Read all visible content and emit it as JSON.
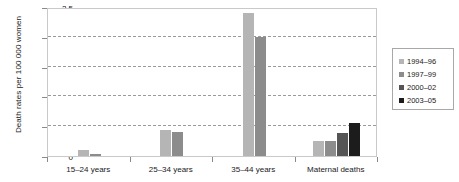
{
  "chart_data": {
    "type": "bar",
    "title": "",
    "xlabel": "",
    "ylabel": "Death rates per 100 000 women",
    "ylim": [
      0,
      2.5
    ],
    "ytick_values": [
      0,
      0.5,
      1,
      1.5,
      2,
      2.5
    ],
    "ytick_labels": [
      "0",
      "0.5",
      "1",
      "1.5",
      "2",
      "2.5"
    ],
    "grid": true,
    "grid_style": "dashed-horizontal",
    "legend_position": "right",
    "categories": [
      "15–24 years",
      "25–34 years",
      "35–44 years",
      "Maternal deaths"
    ],
    "series": [
      {
        "name": "1994–96",
        "color": "#b5b5b5",
        "values": [
          0.1,
          0.43,
          2.4,
          0.26
        ]
      },
      {
        "name": "1997–99",
        "color": "#8c8c8c",
        "values": [
          0.04,
          0.4,
          2.0,
          0.25
        ]
      },
      {
        "name": "2000–02",
        "color": "#555555",
        "values": [
          0,
          0,
          0,
          0.38
        ]
      },
      {
        "name": "2003–05",
        "color": "#1c1c1c",
        "values": [
          0,
          0,
          0,
          0.55
        ]
      }
    ]
  },
  "axis": {
    "y_title": "Death rates per 100 000 women"
  }
}
